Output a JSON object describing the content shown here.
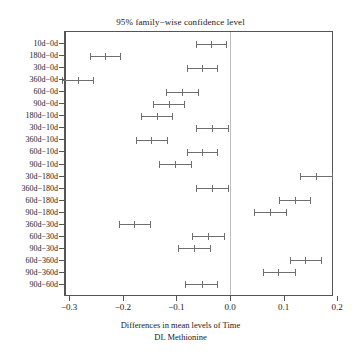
{
  "chart_data": {
    "type": "scatter",
    "title": "95% family−wise confidence level",
    "xlabel_line1": "Differences in mean levels of Time",
    "xlabel_line2": "DL Methionine",
    "ylabel": "",
    "xlim": [
      -0.3055,
      0.19
    ],
    "xticks": [
      -0.3,
      -0.2,
      -0.1,
      0.0,
      0.1,
      0.2
    ],
    "xtick_labels": [
      "−0.3",
      "−0.2",
      "−0.1",
      "0.0",
      "0.1",
      "0.2"
    ],
    "grid": false,
    "legend": "none",
    "zero_reference_line": 0.0,
    "categories": [
      "10d−0d",
      "180d−0d",
      "30d−0d",
      "360d−0d",
      "60d−0d",
      "90d−0d",
      "180d−10d",
      "30d−10d",
      "360d−10d",
      "60d−10d",
      "90d−10d",
      "30d−180d",
      "360d−180d",
      "60d−180d",
      "90d−180d",
      "360d−30d",
      "60d−30d",
      "90d−30d",
      "60d−360d",
      "90d−360d",
      "90d−60d"
    ],
    "series": [
      {
        "name": "mean difference",
        "values": [
          -0.037,
          -0.235,
          -0.0535,
          -0.2855,
          -0.0905,
          -0.1165,
          -0.1385,
          -0.0355,
          -0.1485,
          -0.0535,
          -0.1045,
          0.1595,
          -0.0355,
          0.1185,
          0.0725,
          -0.1805,
          -0.0425,
          -0.069,
          0.1385,
          0.0885,
          -0.055
        ]
      },
      {
        "name": "lower confidence limit",
        "values": [
          -0.0648,
          -0.2629,
          -0.0815,
          -0.3148,
          -0.1204,
          -0.1463,
          -0.1685,
          -0.0648,
          -0.1778,
          -0.0815,
          -0.1352,
          0.1296,
          -0.0648,
          0.0889,
          0.0426,
          -0.2093,
          -0.0722,
          -0.0982,
          0.1093,
          0.0593,
          -0.0852
        ]
      },
      {
        "name": "upper confidence limit",
        "values": [
          -0.0093,
          -0.2074,
          -0.0259,
          -0.2574,
          -0.0611,
          -0.087,
          -0.1093,
          -0.0056,
          -0.1185,
          -0.0259,
          -0.0741,
          0.1889,
          -0.0056,
          0.1481,
          0.1019,
          -0.1519,
          -0.013,
          -0.0389,
          0.1685,
          0.1185,
          -0.0259
        ]
      }
    ]
  }
}
